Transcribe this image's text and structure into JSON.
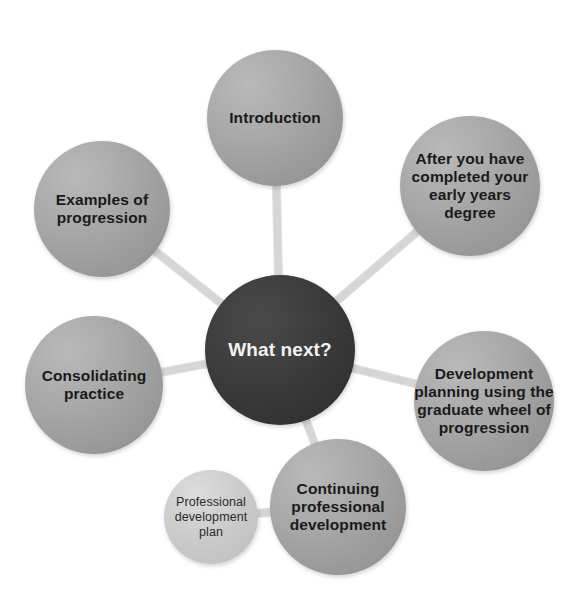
{
  "diagram": {
    "title": "What next?",
    "center": {
      "id": "what-next",
      "label": "What next?",
      "style": "dark"
    },
    "nodes": [
      {
        "id": "introduction",
        "label": "Introduction",
        "style": "grey",
        "connects_to": "what-next"
      },
      {
        "id": "after-degree",
        "label": "After you have\ncompleted your\nearly years\ndegree",
        "style": "grey",
        "connects_to": "what-next"
      },
      {
        "id": "examples-progression",
        "label": "Examples of\nprogression",
        "style": "grey",
        "connects_to": "what-next"
      },
      {
        "id": "consolidating-practice",
        "label": "Consolidating\npractice",
        "style": "grey",
        "connects_to": "what-next"
      },
      {
        "id": "development-planning",
        "label": "Development\nplanning using the\ngraduate wheel of\nprogression",
        "style": "grey",
        "connects_to": "what-next"
      },
      {
        "id": "cpd",
        "label": "Continuing\nprofessional\ndevelopment",
        "style": "grey",
        "connects_to": "what-next"
      },
      {
        "id": "pdp",
        "label": "Professional\ndevelopment\nplan",
        "style": "light",
        "connects_to": "cpd"
      }
    ],
    "colors": {
      "center_fill": "#3a3a3a",
      "node_fill": "#a8a8a8",
      "sub_node_fill": "#cccccc",
      "connector": "#d6d6d6",
      "background": "#ffffff"
    }
  }
}
